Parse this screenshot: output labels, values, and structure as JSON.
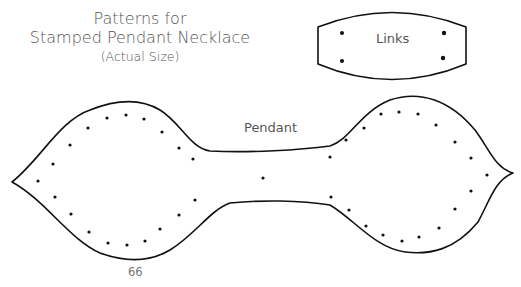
{
  "title": {
    "line1": "Patterns for",
    "line2": "Stamped Pendant Necklace",
    "line3": "(Actual Size)"
  },
  "shapes": {
    "links": {
      "label": "Links",
      "hole_count": 4
    },
    "pendant": {
      "label": "Pendant",
      "hole_count": 51
    }
  },
  "page_number": "66",
  "colors": {
    "outline": "#111111",
    "text": "#555555",
    "background": "#ffffff"
  }
}
